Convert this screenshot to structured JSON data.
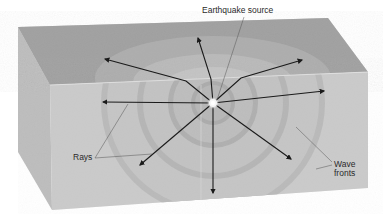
{
  "diagram": {
    "labels": {
      "source": "Earthquake source",
      "rays": "Rays",
      "wave_fronts_line1": "Wave",
      "wave_fronts_line2": "fronts"
    },
    "elements": {
      "block": "Cut-away block of crust (top surface, front face, left side face)",
      "source_point": "Earthquake source (focus) at center of concentric spheres",
      "wave_fronts": "4 concentric spherical wave fronts",
      "rays": "9 arrows radiating outward from source"
    },
    "colors": {
      "top_face": "#a9a9a9",
      "front_face": "#cfcfcf",
      "side_face": "#bdbdbd",
      "wavefront_dark": "#9c9c9c",
      "arrow": "#1a1a1a",
      "text": "#2a2a2a"
    }
  }
}
